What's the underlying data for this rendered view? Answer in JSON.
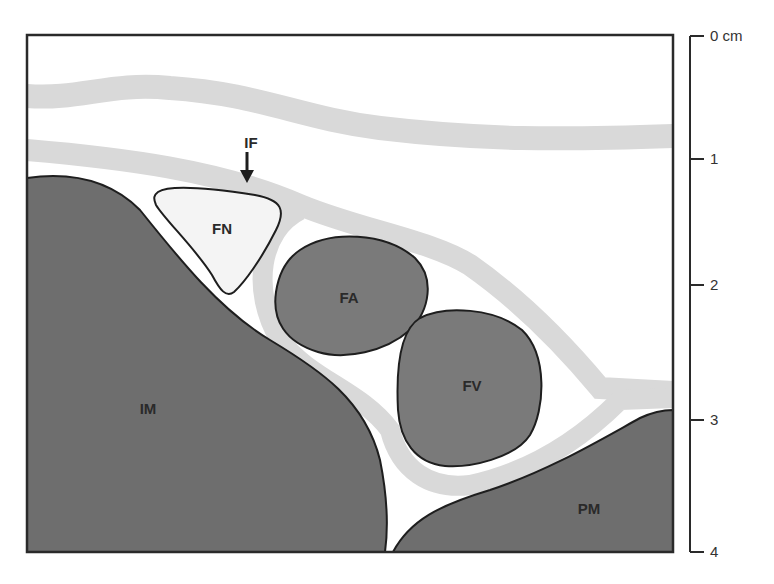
{
  "diagram": {
    "colors": {
      "muscle": "#6e6e6e",
      "vessel": "#7a7a7a",
      "nerve": "#f4f4f4",
      "fascia": "#d9d9d9",
      "outline": "#1e1e1e",
      "background": "#ffffff"
    },
    "structures": [
      {
        "id": "FN",
        "label": "FN"
      },
      {
        "id": "FA",
        "label": "FA"
      },
      {
        "id": "FV",
        "label": "FV"
      },
      {
        "id": "IM",
        "label": "IM"
      },
      {
        "id": "PM",
        "label": "PM"
      },
      {
        "id": "IF",
        "label": "IF"
      }
    ],
    "labels": {
      "fn": "FN",
      "fa": "FA",
      "fv": "FV",
      "im": "IM",
      "pm": "PM",
      "if": "IF"
    },
    "scale": {
      "ticks": [
        "0 cm",
        "1",
        "2",
        "3",
        "4"
      ]
    }
  }
}
